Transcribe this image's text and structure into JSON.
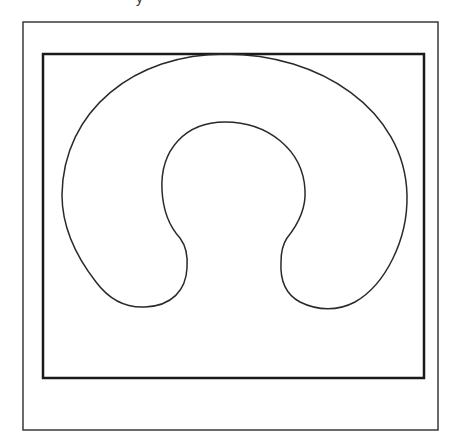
{
  "figure": {
    "top_text_fragment": "y",
    "outer_frame": {
      "x": 23,
      "y": 22,
      "width": 415,
      "height": 408,
      "stroke": "#3a3a3a",
      "stroke_width": 1.5
    },
    "inner_box": {
      "x": 43,
      "y": 54,
      "width": 381,
      "height": 324,
      "stroke": "#1a1a1a",
      "stroke_width": 2.5
    },
    "shape": {
      "name": "horseshoe-outline",
      "stroke": "#2a2a2a",
      "stroke_width": 1.5,
      "fill": "none"
    }
  }
}
